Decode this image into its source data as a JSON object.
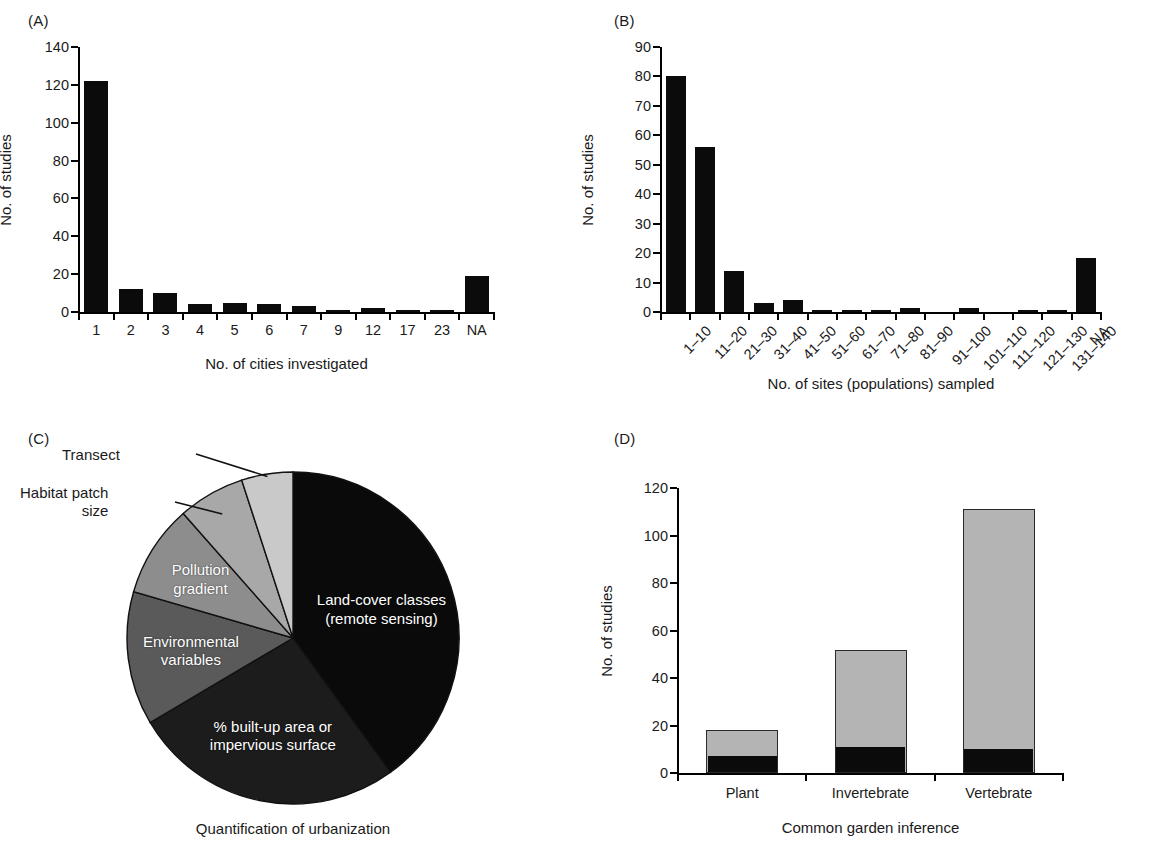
{
  "figure": {
    "panels": [
      "(A)",
      "(B)",
      "(C)",
      "(D)"
    ]
  },
  "chart_data": [
    {
      "panel": "(A)",
      "type": "bar",
      "title": "",
      "xlabel": "No. of cities investigated",
      "ylabel": "No. of studies",
      "categories": [
        "1",
        "2",
        "3",
        "4",
        "5",
        "6",
        "7",
        "9",
        "12",
        "17",
        "23",
        "NA"
      ],
      "values": [
        122,
        12,
        10,
        4,
        5,
        4,
        3,
        1,
        2,
        1,
        0.5,
        19
      ],
      "ylim": [
        0,
        140
      ],
      "yticks": [
        0,
        20,
        40,
        60,
        80,
        100,
        120,
        140
      ],
      "grid": false,
      "legend": "none",
      "bar_color": "#0b0b0b"
    },
    {
      "panel": "(B)",
      "type": "bar",
      "title": "",
      "xlabel": "No. of sites (populations) sampled",
      "ylabel": "No. of studies",
      "categories": [
        "1–10",
        "11–20",
        "21–30",
        "31–40",
        "41–50",
        "51–60",
        "61–70",
        "71–80",
        "81–90",
        "91–100",
        "101–110",
        "111–120",
        "121–130",
        "131–140",
        "NA"
      ],
      "values": [
        80,
        56,
        14,
        3,
        4,
        0.5,
        0.5,
        0.5,
        1.2,
        0,
        1.2,
        0,
        0.5,
        0.5,
        18.5
      ],
      "ylim": [
        0,
        90
      ],
      "yticks": [
        0,
        10,
        20,
        30,
        40,
        50,
        60,
        70,
        80,
        90
      ],
      "grid": false,
      "legend": "none",
      "bar_color": "#0b0b0b"
    },
    {
      "panel": "(C)",
      "type": "pie",
      "title": "",
      "caption": "Quantification of urbanization",
      "slices": [
        {
          "label": "Land-cover classes\n(remote sensing)",
          "value": 40.0,
          "color": "#0a0a0a",
          "label_position": "inside"
        },
        {
          "label": "% built-up area or\nimpervious surface",
          "value": 26.5,
          "color": "#1c1c1c",
          "label_position": "inside"
        },
        {
          "label": "Environmental\nvariables",
          "value": 13.0,
          "color": "#5a5a5a",
          "label_position": "inside"
        },
        {
          "label": "Pollution\ngradient",
          "value": 9.0,
          "color": "#8d8d8d",
          "label_position": "inside"
        },
        {
          "label": "Habitat patch\nsize",
          "value": 6.5,
          "color": "#a8a8a8",
          "label_position": "outside"
        },
        {
          "label": "Transect",
          "value": 5.0,
          "color": "#c9c9c9",
          "label_position": "outside"
        }
      ],
      "legend": "none"
    },
    {
      "panel": "(D)",
      "type": "bar",
      "subtype": "stacked",
      "title": "",
      "xlabel": "Common garden inference",
      "ylabel": "No. of studies",
      "categories": [
        "Plant",
        "Invertebrate",
        "Vertebrate"
      ],
      "series": [
        {
          "name": "dark-segment",
          "values": [
            7,
            11,
            10
          ],
          "color": "#0b0b0b"
        },
        {
          "name": "light-segment",
          "values": [
            11,
            41,
            101
          ],
          "color": "#b4b4b4"
        }
      ],
      "totals": [
        18,
        52,
        111
      ],
      "ylim": [
        0,
        120
      ],
      "yticks": [
        0,
        20,
        40,
        60,
        80,
        100,
        120
      ],
      "grid": false,
      "legend": "none"
    }
  ]
}
